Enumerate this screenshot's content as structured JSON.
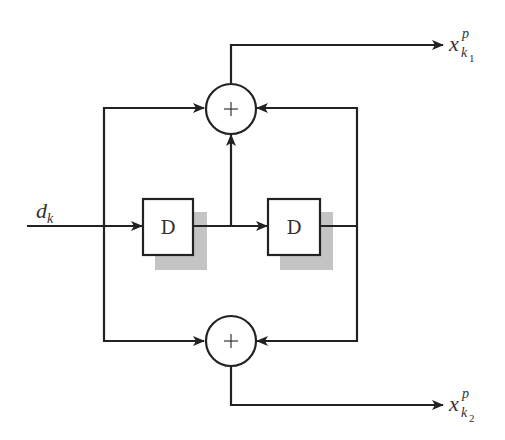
{
  "diagram": {
    "type": "convolutional-encoder",
    "input": {
      "label_main": "d",
      "label_sub": "k"
    },
    "delay_elements": [
      {
        "label": "D"
      },
      {
        "label": "D"
      }
    ],
    "adders": [
      {
        "symbol": "+"
      },
      {
        "symbol": "+"
      }
    ],
    "outputs": [
      {
        "label_main": "x",
        "label_sup": "p",
        "label_sub": "k",
        "label_subsub": "1"
      },
      {
        "label_main": "x",
        "label_sup": "p",
        "label_sub": "k",
        "label_subsub": "2"
      }
    ],
    "colors": {
      "line": "#222222",
      "shadow": "#c4c4c4",
      "background": "#ffffff"
    }
  }
}
